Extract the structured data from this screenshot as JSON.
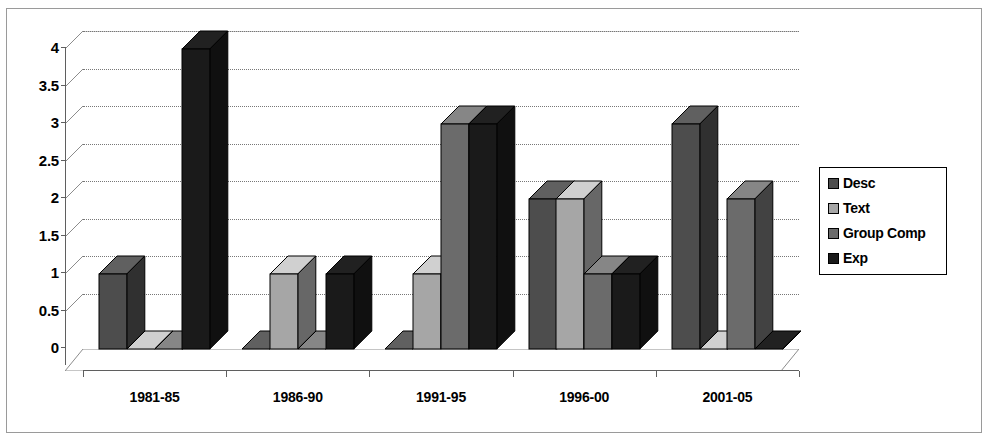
{
  "chart_data": {
    "type": "bar",
    "title": "",
    "subtitle": "",
    "xlabel": "",
    "ylabel": "",
    "categories": [
      "1981-85",
      "1986-90",
      "1991-95",
      "1996-00",
      "2001-05"
    ],
    "series": [
      {
        "name": "Desc",
        "values": [
          1,
          0,
          0,
          2,
          3
        ],
        "color": "#4d4d4d"
      },
      {
        "name": "Text",
        "values": [
          0,
          1,
          1,
          2,
          0
        ],
        "color": "#a6a6a6"
      },
      {
        "name": "Group Comp",
        "values": [
          0,
          0,
          3,
          1,
          2
        ],
        "color": "#6b6b6b"
      },
      {
        "name": "Exp",
        "values": [
          4,
          1,
          3,
          1,
          0
        ],
        "color": "#1a1a1a"
      }
    ],
    "ylim": [
      0,
      4
    ],
    "ytick_labels": [
      "0",
      "0.5",
      "1",
      "1.5",
      "2",
      "2.5",
      "3",
      "3.5",
      "4"
    ],
    "ytick_values": [
      0,
      0.5,
      1,
      1.5,
      2,
      2.5,
      3,
      3.5,
      4
    ],
    "grid": true,
    "grid_axis": "y",
    "legend_position": "right",
    "style": "3d-column",
    "plot_background": "#ffffff",
    "border_color": "#9a9a9a"
  },
  "legend": {
    "items": [
      {
        "label": "Desc"
      },
      {
        "label": "Text"
      },
      {
        "label": "Group Comp"
      },
      {
        "label": "Exp"
      }
    ]
  }
}
